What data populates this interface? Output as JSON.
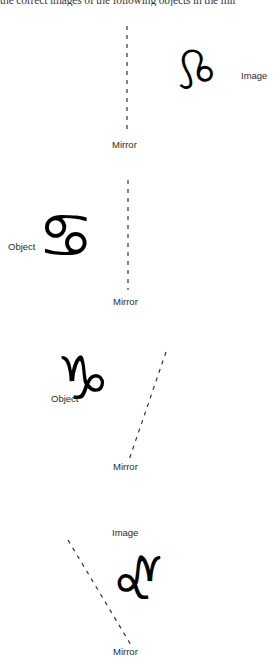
{
  "document": {
    "type": "mirror-reflection-worksheet",
    "instruction": "the correct images of the following objects in the mir",
    "background_color": "#ffffff",
    "ink_color": "#000000",
    "label_color": "#2b2b2b"
  },
  "panels": [
    {
      "id": "panel-1",
      "glyph": "♌",
      "glyph_name": "leo-symbol-mirrored",
      "glyph_flipped": true,
      "glyph_label": "Image",
      "mirror_label": "Mirror",
      "mirror_orientation": "vertical"
    },
    {
      "id": "panel-2",
      "glyph": "♋",
      "glyph_name": "cancer-symbol",
      "glyph_flipped": false,
      "glyph_label": "Object",
      "mirror_label": "Mirror",
      "mirror_orientation": "vertical"
    },
    {
      "id": "panel-3",
      "glyph": "♑",
      "glyph_name": "capricorn-symbol",
      "glyph_flipped": false,
      "glyph_label": "Object",
      "mirror_label": "Mirror",
      "mirror_orientation": "tilted-right"
    },
    {
      "id": "panel-4",
      "glyph": "♑",
      "glyph_name": "capricorn-symbol-mirrored",
      "glyph_flipped": true,
      "glyph_label": "Image",
      "mirror_label": "Mirror",
      "mirror_orientation": "tilted-left"
    }
  ]
}
